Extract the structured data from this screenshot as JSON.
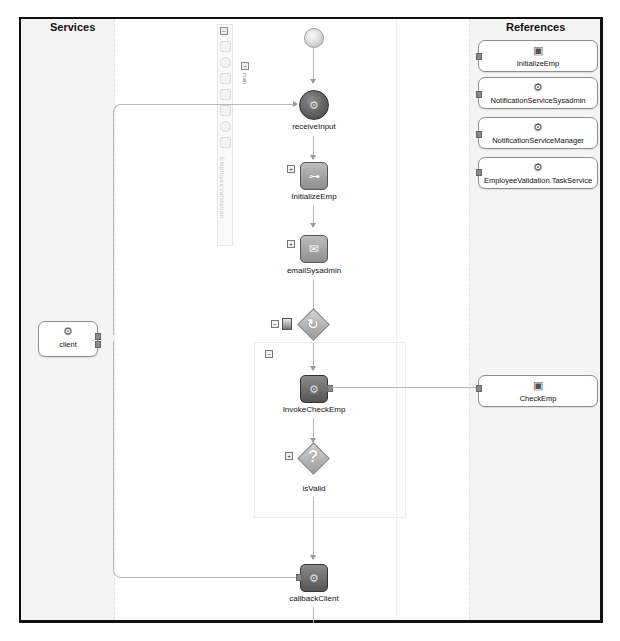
{
  "diagram": {
    "type": "bpel-process",
    "lanes": {
      "services_title": "Services",
      "references_title": "References"
    },
    "palette": {
      "collapse_symbol": "⊟",
      "icons": [
        "variables-icon",
        "partner-links-icon",
        "correlation-icon",
        "events-icon",
        "scope-icon",
        "fault-icon",
        "compensation-icon"
      ],
      "vertical_label": "EmployeeValidation",
      "main_label": "main"
    },
    "services": [
      {
        "id": "client",
        "label": "client",
        "icon": "gear-icon"
      }
    ],
    "references": [
      {
        "id": "initialize-emp-ref",
        "label": "InitializeEmp",
        "icon": "adapter-icon"
      },
      {
        "id": "notification-sysadmin-ref",
        "label": "NotificationServiceSysadmin",
        "icon": "gear-icon"
      },
      {
        "id": "notification-manager-ref",
        "label": "NotificationServiceManager",
        "icon": "gear-icon"
      },
      {
        "id": "employee-validation-task-ref",
        "label": "EmployeeValidation.TaskService",
        "icon": "gear-icon"
      },
      {
        "id": "check-emp-ref",
        "label": "CheckEmp",
        "icon": "adapter-icon"
      }
    ],
    "activities": [
      {
        "id": "start",
        "type": "start",
        "label": ""
      },
      {
        "id": "receiveInput",
        "type": "receive",
        "label": "receiveInput"
      },
      {
        "id": "InitializeEmp",
        "type": "assign",
        "label": "InitializeEmp",
        "expand": "+"
      },
      {
        "id": "emailSysadmin",
        "type": "email",
        "label": "emailSysadmin",
        "expand": "+"
      },
      {
        "id": "while-loop",
        "type": "while",
        "label": "",
        "expand": "−"
      },
      {
        "id": "loop-scope",
        "type": "sequence",
        "label": "",
        "expand": "−"
      },
      {
        "id": "InvokeCheckEmp",
        "type": "invoke",
        "label": "InvokeCheckEmp"
      },
      {
        "id": "isValid",
        "type": "switch",
        "label": "isValid",
        "expand": "+"
      },
      {
        "id": "callbackClient",
        "type": "invoke",
        "label": "callbackClient"
      }
    ],
    "connections": [
      {
        "from": "client",
        "to": "receiveInput"
      },
      {
        "from": "InvokeCheckEmp",
        "to": "CheckEmp"
      },
      {
        "from": "callbackClient",
        "to": "client"
      }
    ],
    "glyphs": {
      "gear": "⚙",
      "question": "?",
      "loop": "↻",
      "envelope": "✉",
      "tree": "⊶",
      "adapter": "▣",
      "plus": "+",
      "minus": "−"
    }
  }
}
